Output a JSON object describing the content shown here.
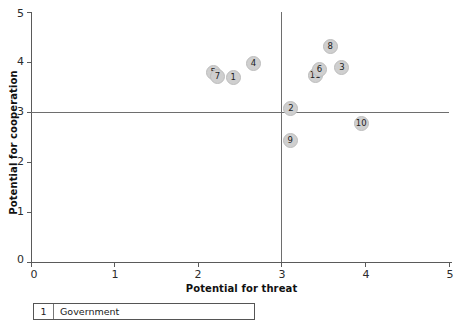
{
  "chart_data": {
    "type": "scatter",
    "title": "",
    "xlabel": "Potential for threat",
    "ylabel": "Potential for cooperation",
    "xlim": [
      0,
      5
    ],
    "ylim": [
      0,
      5
    ],
    "xticks": [
      "0",
      "1",
      "2",
      "3",
      "4",
      "5"
    ],
    "yticks": [
      "0",
      "1",
      "2",
      "3",
      "4",
      "5"
    ],
    "grid": false,
    "legend_position": "below-plot",
    "reference_lines": {
      "vertical_x": 3,
      "horizontal_y": 3
    },
    "points": [
      {
        "label": "5",
        "x": 2.18,
        "y": 3.8
      },
      {
        "label": "7",
        "x": 2.23,
        "y": 3.72
      },
      {
        "label": "1",
        "x": 2.42,
        "y": 3.7
      },
      {
        "label": "4",
        "x": 2.66,
        "y": 3.98
      },
      {
        "label": "2",
        "x": 3.11,
        "y": 3.08
      },
      {
        "label": "9",
        "x": 3.1,
        "y": 2.44
      },
      {
        "label": "11",
        "x": 3.4,
        "y": 3.74
      },
      {
        "label": "6",
        "x": 3.45,
        "y": 3.86
      },
      {
        "label": "8",
        "x": 3.58,
        "y": 4.32
      },
      {
        "label": "3",
        "x": 3.72,
        "y": 3.9
      },
      {
        "label": "10",
        "x": 3.95,
        "y": 2.78
      }
    ]
  },
  "legend": {
    "rows": [
      {
        "key": "1",
        "name": "Government"
      }
    ]
  }
}
